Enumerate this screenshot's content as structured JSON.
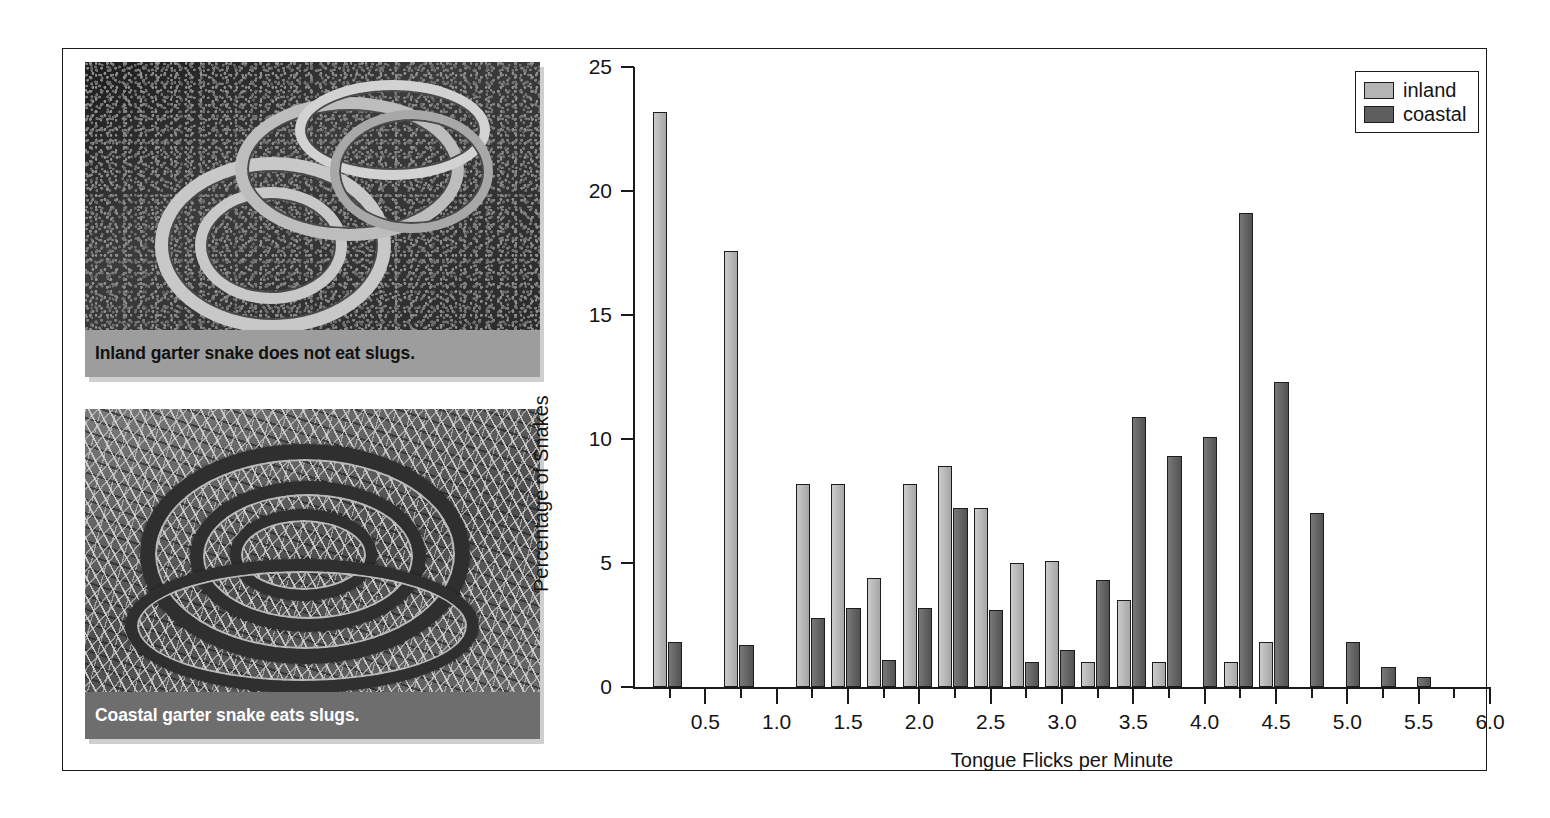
{
  "figure": {
    "panels": [
      {
        "id": "inland-photo",
        "caption": "Inland garter snake does not eat slugs.",
        "caption_style": "light",
        "alt": "inland-garter-snake-photo"
      },
      {
        "id": "coastal-photo",
        "caption": "Coastal garter snake eats slugs.",
        "caption_style": "dark",
        "alt": "coastal-garter-snake-photo"
      }
    ]
  },
  "colors": {
    "inland": "#b4b4b4",
    "coastal": "#5e5e5e",
    "axis": "#1a1a1a",
    "frame": "#1a1a1a",
    "caption_light": "#9d9d9d",
    "caption_dark": "#6e6e6e"
  },
  "chart_data": {
    "type": "bar",
    "title": "",
    "xlabel": "Tongue Flicks per Minute",
    "ylabel": "Percentage of Snakes",
    "xlim": [
      0,
      6.0
    ],
    "ylim": [
      0,
      25
    ],
    "ytick_labels": [
      "0",
      "5",
      "10",
      "15",
      "20",
      "25"
    ],
    "ytick_values": [
      0,
      5,
      10,
      15,
      20,
      25
    ],
    "xtick_labels": [
      "0.5",
      "1.0",
      "1.5",
      "2.0",
      "2.5",
      "3.0",
      "3.5",
      "4.0",
      "4.5",
      "5.0",
      "5.5",
      "6.0"
    ],
    "xtick_values": [
      0.5,
      1.0,
      1.5,
      2.0,
      2.5,
      3.0,
      3.5,
      4.0,
      4.5,
      5.0,
      5.5,
      6.0
    ],
    "xtick_minor_values": [
      0.25,
      0.75,
      1.25,
      1.75,
      2.25,
      2.75,
      3.25,
      3.75,
      4.25,
      4.75,
      5.25,
      5.75
    ],
    "grid": false,
    "legend_position": "top-right",
    "legend": [
      "inland",
      "coastal"
    ],
    "bin_width": 0.25,
    "x": [
      0.25,
      0.75,
      1.25,
      1.5,
      1.75,
      2.0,
      2.25,
      2.5,
      2.75,
      3.0,
      3.25,
      3.5,
      3.75,
      4.0,
      4.25,
      4.5,
      4.75,
      5.0,
      5.25,
      5.5
    ],
    "series": [
      {
        "name": "inland",
        "color": "#b4b4b4",
        "values": [
          23.2,
          17.6,
          8.2,
          8.2,
          4.4,
          8.2,
          8.9,
          7.2,
          5.0,
          5.1,
          1.0,
          3.5,
          1.0,
          0,
          1.0,
          1.8,
          0,
          0,
          0,
          0
        ]
      },
      {
        "name": "coastal",
        "color": "#5e5e5e",
        "values": [
          1.8,
          1.7,
          2.8,
          3.2,
          1.1,
          3.2,
          7.2,
          3.1,
          1.0,
          1.5,
          4.3,
          10.9,
          9.3,
          10.1,
          19.1,
          12.3,
          7.0,
          1.8,
          0.8,
          0.4
        ]
      }
    ]
  }
}
